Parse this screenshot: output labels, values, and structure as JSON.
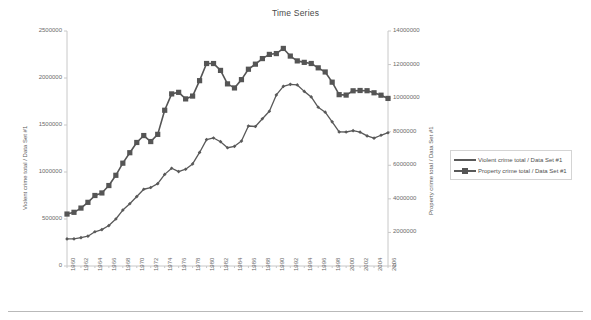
{
  "chart_data": {
    "type": "line",
    "title": "Time Series",
    "xlabel": "",
    "ylabel": "Violent crime total / Data Set #1",
    "y2label": "Property crime total / Data Set #1",
    "grid": false,
    "legend_position": "right",
    "x": [
      1960,
      1961,
      1962,
      1963,
      1964,
      1965,
      1966,
      1967,
      1968,
      1969,
      1970,
      1971,
      1972,
      1973,
      1974,
      1975,
      1976,
      1977,
      1978,
      1979,
      1980,
      1981,
      1982,
      1983,
      1984,
      1985,
      1986,
      1987,
      1988,
      1989,
      1990,
      1991,
      1992,
      1993,
      1994,
      1995,
      1996,
      1997,
      1998,
      1999,
      2000,
      2001,
      2002,
      2003,
      2004,
      2005,
      2006
    ],
    "xtick_labels": [
      "1960",
      "1962",
      "1964",
      "1966",
      "1968",
      "1970",
      "1972",
      "1974",
      "1976",
      "1978",
      "1980",
      "1982",
      "1984",
      "1986",
      "1988",
      "1990",
      "1992",
      "1994",
      "1996",
      "1998",
      "2000",
      "2002",
      "2004",
      "2006"
    ],
    "ylim": [
      0,
      2500000
    ],
    "ytick_labels": [
      "0",
      "500000",
      "1000000",
      "1500000",
      "2000000",
      "2500000"
    ],
    "yticks": [
      0,
      500000,
      1000000,
      1500000,
      2000000,
      2500000
    ],
    "y2lim": [
      0,
      14000000
    ],
    "y2tick_labels": [
      "0",
      "2000000",
      "4000000",
      "6000000",
      "8000000",
      "10000000",
      "12000000",
      "14000000"
    ],
    "y2ticks": [
      0,
      2000000,
      4000000,
      6000000,
      8000000,
      10000000,
      12000000,
      14000000
    ],
    "series": [
      {
        "name": "Violent crime total / Data Set #1",
        "axis": "left",
        "marker": "diamond",
        "color": "#595959",
        "values": [
          288460,
          289390,
          301510,
          316970,
          364220,
          387390,
          430180,
          499930,
          595010,
          661870,
          738820,
          816500,
          834900,
          875910,
          974720,
          1039710,
          1004210,
          1029580,
          1085550,
          1208030,
          1344520,
          1361820,
          1322390,
          1258087,
          1273282,
          1328800,
          1489169,
          1483999,
          1566221,
          1646037,
          1820127,
          1911767,
          1932274,
          1926017,
          1857670,
          1798792,
          1688540,
          1636096,
          1533887,
          1426044,
          1425486,
          1439480,
          1423677,
          1383676,
          1360088,
          1390745,
          1417745
        ]
      },
      {
        "name": "Property crime total / Data Set #1",
        "axis": "right",
        "marker": "square",
        "color": "#555555",
        "values": [
          3095700,
          3198600,
          3450700,
          3792500,
          4200400,
          4352000,
          4793300,
          5403500,
          6125200,
          6749000,
          7359200,
          7771700,
          7413900,
          7842200,
          9278700,
          10252700,
          10345500,
          9955000,
          10123400,
          11041500,
          12063700,
          12061900,
          11652000,
          10850543,
          10608473,
          11102590,
          11722700,
          12024709,
          12356865,
          12605412,
          12655486,
          12961116,
          12505917,
          12218777,
          12131873,
          12063935,
          11805323,
          11558475,
          10951827,
          10208334,
          10182584,
          10437189,
          10455277,
          10442862,
          10319386,
          10174754,
          9983568
        ]
      }
    ]
  },
  "legend": {
    "items": [
      {
        "label": "Violent crime total / Data Set #1",
        "marker": "none"
      },
      {
        "label": "Property crime total / Data Set #1",
        "marker": "square"
      }
    ]
  },
  "colors": {
    "violent": "#595959",
    "property": "#555555",
    "axis": "#c8c8c8",
    "text": "#6b6b6b",
    "background": "#ffffff"
  }
}
